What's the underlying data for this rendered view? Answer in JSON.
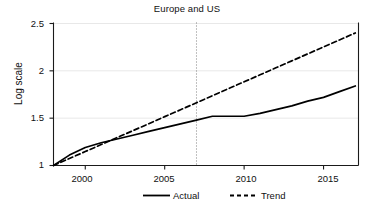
{
  "chart_data": {
    "type": "line",
    "title": "Europe and US",
    "xlabel": "",
    "ylabel": "Log scale",
    "xlim": [
      1998,
      2017.2
    ],
    "ylim": [
      1.0,
      2.5
    ],
    "xticks": [
      2000,
      2005,
      2010,
      2015
    ],
    "xtick_labels": [
      "2000",
      "2005",
      "2010",
      "2015"
    ],
    "yticks": [
      1,
      1.5,
      2,
      2.5
    ],
    "ytick_labels": [
      "1",
      "1.5",
      "2",
      "2.5"
    ],
    "grid": "horizontal",
    "legend_position": "below",
    "annotations": [
      {
        "name": "crisis-reference-line",
        "type": "vertical-dotted-line",
        "x": 2007
      }
    ],
    "x": [
      1998,
      1999,
      2000,
      2001,
      2002,
      2003,
      2004,
      2005,
      2006,
      2007,
      2008,
      2009,
      2010,
      2011,
      2012,
      2013,
      2014,
      2015,
      2016,
      2017
    ],
    "series": [
      {
        "name": "Actual",
        "style": "solid",
        "color": "#000000",
        "values": [
          1.0,
          1.11,
          1.19,
          1.24,
          1.28,
          1.32,
          1.36,
          1.4,
          1.44,
          1.48,
          1.52,
          1.52,
          1.52,
          1.55,
          1.59,
          1.63,
          1.68,
          1.72,
          1.78,
          1.84
        ]
      },
      {
        "name": "Trend",
        "style": "dashed",
        "color": "#000000",
        "values": [
          1.0,
          1.074,
          1.147,
          1.221,
          1.295,
          1.368,
          1.442,
          1.516,
          1.589,
          1.663,
          1.737,
          1.811,
          1.884,
          1.958,
          2.032,
          2.105,
          2.179,
          2.253,
          2.326,
          2.4
        ]
      }
    ]
  },
  "legend": {
    "items": [
      {
        "label": "Actual",
        "style": "solid"
      },
      {
        "label": "Trend",
        "style": "dashed"
      }
    ]
  },
  "colors": {
    "axis": "#1a1a1a",
    "grid": "#e8e8e8",
    "line": "#000000",
    "reference_line": "#808080",
    "background": "#ffffff"
  }
}
